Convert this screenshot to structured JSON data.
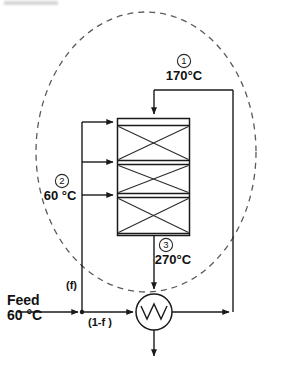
{
  "diagram": {
    "boundary": {
      "name": "system-boundary",
      "style": "dashed-ellipse"
    },
    "streams": [
      {
        "tag": "1",
        "tag_display": "1",
        "temperature": "170°C",
        "label_name": "stream-1-label",
        "description": "reactor inlet after preheat"
      },
      {
        "tag": "2",
        "tag_display": "2",
        "temperature": "60 °C",
        "label_name": "stream-2-label",
        "description": "cold shot quench streams"
      },
      {
        "tag": "3",
        "tag_display": "3",
        "temperature": "270°C",
        "label_name": "stream-3-label",
        "description": "reactor effluent"
      }
    ],
    "feed": {
      "label": "Feed",
      "temperature": "60 °C"
    },
    "split_fractions": {
      "bypass": "(f)",
      "through": "(1-f )"
    },
    "reactor": {
      "name": "multi-bed-reactor",
      "bed_count": 3,
      "quench_inlet_count": 3
    },
    "heat_exchanger": {
      "name": "feed-effluent-heat-exchanger",
      "symbol": "circle-with-zigzag"
    },
    "product": {
      "name": "product-outlet-arrow"
    },
    "colors": {
      "line": "#1a1a1a",
      "boundary": "#5a5a5a",
      "background": "#ffffff",
      "text": "#111111"
    }
  }
}
